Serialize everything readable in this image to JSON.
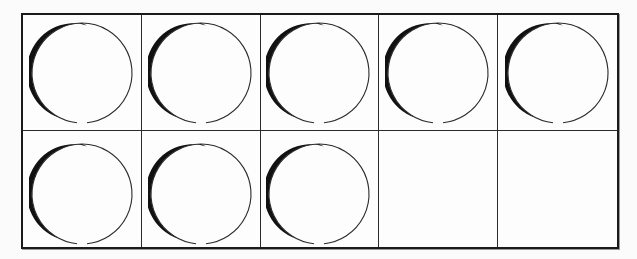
{
  "diagram": {
    "type": "ten-frame",
    "rows": 2,
    "columns": 5,
    "filled_count": 8,
    "empty_count": 2,
    "total_cells": 10,
    "counter_shape": "circle",
    "colors": {
      "border": "#1a1a1a",
      "counter_outline": "#2a2a2a",
      "counter_shadow": "#111111",
      "background": "#fdfdfd"
    },
    "cells": [
      {
        "row": 1,
        "col": 1,
        "filled": true
      },
      {
        "row": 1,
        "col": 2,
        "filled": true
      },
      {
        "row": 1,
        "col": 3,
        "filled": true
      },
      {
        "row": 1,
        "col": 4,
        "filled": true
      },
      {
        "row": 1,
        "col": 5,
        "filled": true
      },
      {
        "row": 2,
        "col": 1,
        "filled": true
      },
      {
        "row": 2,
        "col": 2,
        "filled": true
      },
      {
        "row": 2,
        "col": 3,
        "filled": true
      },
      {
        "row": 2,
        "col": 4,
        "filled": false
      },
      {
        "row": 2,
        "col": 5,
        "filled": false
      }
    ]
  }
}
